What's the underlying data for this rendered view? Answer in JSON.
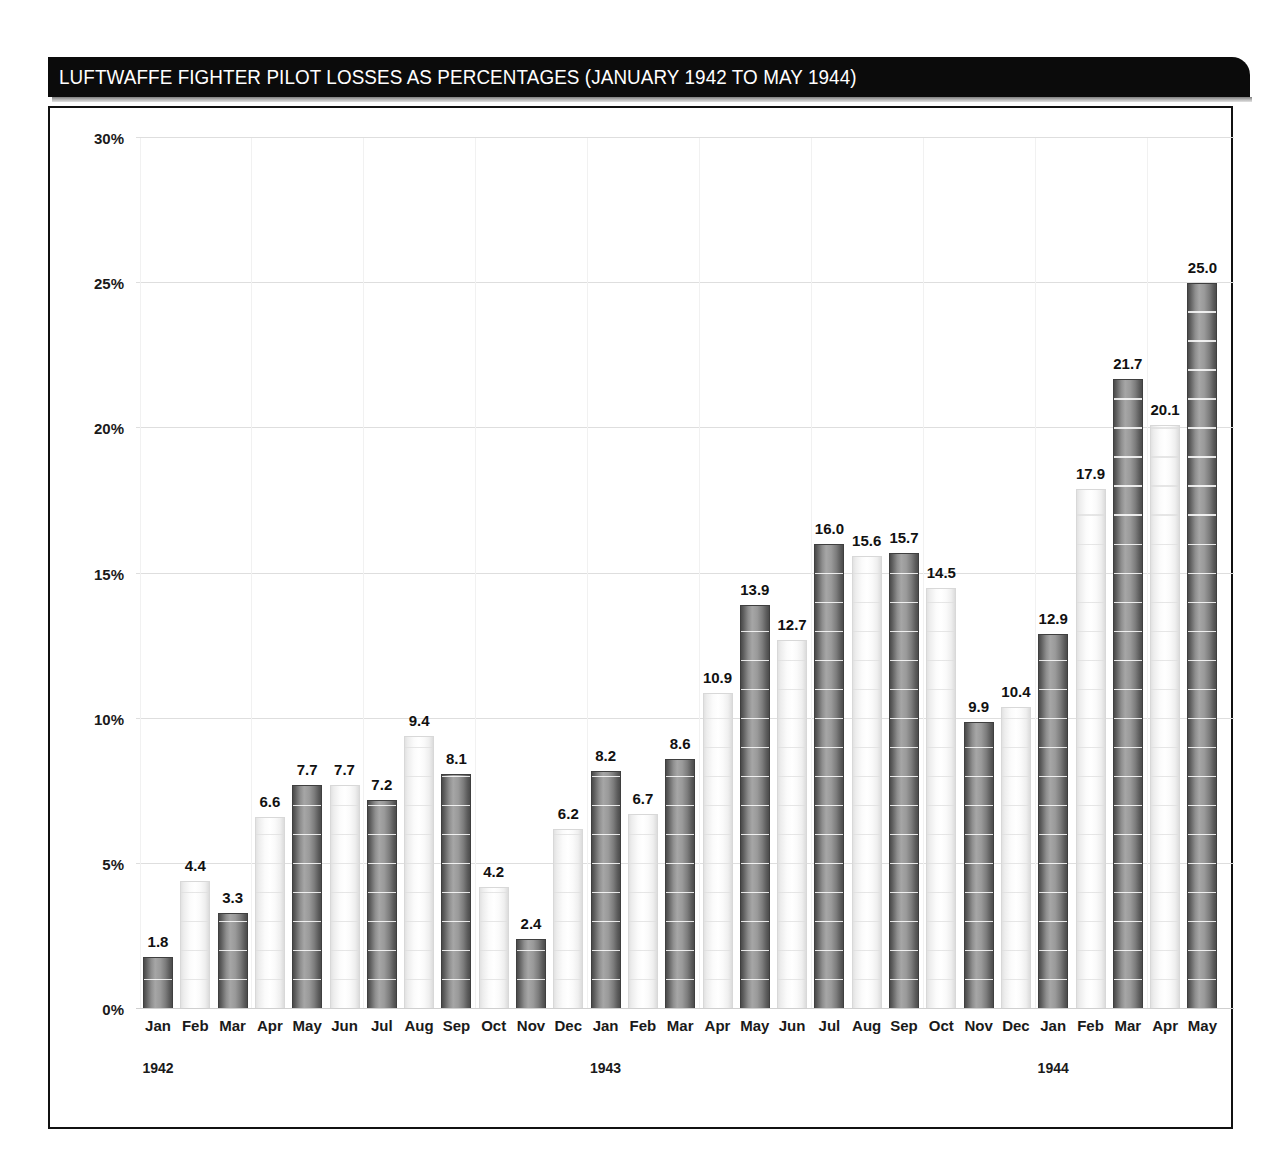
{
  "title": "LUFTWAFFE FIGHTER PILOT LOSSES AS PERCENTAGES (JANUARY 1942 TO MAY 1944)",
  "colors": {
    "title_bar_bg": "#0b0b0b",
    "title_text": "#ffffff",
    "frame_border": "#111111",
    "bar_dark": "#8e8e8e",
    "bar_light": "#f7f7f7",
    "grid": "#e9e9e9",
    "text": "#1a1a1a"
  },
  "axes": {
    "y_ticks": [
      "0%",
      "5%",
      "10%",
      "15%",
      "20%",
      "25%",
      "30%"
    ],
    "y_tick_values": [
      0,
      5,
      10,
      15,
      20,
      25,
      30
    ],
    "year_groups": [
      {
        "label": "1942",
        "start_index": 0,
        "count": 12
      },
      {
        "label": "1943",
        "start_index": 12,
        "count": 12
      },
      {
        "label": "1944",
        "start_index": 24,
        "count": 5
      }
    ]
  },
  "chart_data": {
    "type": "bar",
    "title": "LUFTWAFFE FIGHTER PILOT LOSSES AS PERCENTAGES (JANUARY 1942 TO MAY 1944)",
    "xlabel": "",
    "ylabel": "",
    "ylim": [
      0,
      30
    ],
    "y_tick_step": 5,
    "grid": true,
    "legend": false,
    "categories": [
      "Jan",
      "Feb",
      "Mar",
      "Apr",
      "May",
      "Jun",
      "Jul",
      "Aug",
      "Sep",
      "Oct",
      "Nov",
      "Dec",
      "Jan",
      "Feb",
      "Mar",
      "Apr",
      "May",
      "Jun",
      "Jul",
      "Aug",
      "Sep",
      "Oct",
      "Nov",
      "Dec",
      "Jan",
      "Feb",
      "Mar",
      "Apr",
      "May"
    ],
    "years": [
      "1942",
      "1942",
      "1942",
      "1942",
      "1942",
      "1942",
      "1942",
      "1942",
      "1942",
      "1942",
      "1942",
      "1942",
      "1943",
      "1943",
      "1943",
      "1943",
      "1943",
      "1943",
      "1943",
      "1943",
      "1943",
      "1943",
      "1943",
      "1943",
      "1944",
      "1944",
      "1944",
      "1944",
      "1944"
    ],
    "values": [
      1.8,
      4.4,
      3.3,
      6.6,
      7.7,
      7.7,
      7.2,
      9.4,
      8.1,
      4.2,
      2.4,
      6.2,
      8.2,
      6.7,
      8.6,
      10.9,
      13.9,
      12.7,
      16.0,
      15.6,
      15.7,
      14.5,
      9.9,
      10.4,
      12.9,
      17.9,
      21.7,
      20.1,
      25.0
    ],
    "labels": [
      "1.8",
      "4.4",
      "3.3",
      "6.6",
      "7.7",
      "7.7",
      "7.2",
      "9.4",
      "8.1",
      "4.2",
      "2.4",
      "6.2",
      "8.2",
      "6.7",
      "8.6",
      "10.9",
      "13.9",
      "12.7",
      "16.0",
      "15.6",
      "15.7",
      "14.5",
      "9.9",
      "10.4",
      "12.9",
      "17.9",
      "21.7",
      "20.1",
      "25.0"
    ],
    "shading": [
      "dark",
      "light",
      "dark",
      "light",
      "dark",
      "light",
      "dark",
      "light",
      "dark",
      "light",
      "dark",
      "light",
      "dark",
      "light",
      "dark",
      "light",
      "dark",
      "light",
      "dark",
      "light",
      "dark",
      "light",
      "dark",
      "light",
      "dark",
      "light",
      "dark",
      "light",
      "dark"
    ]
  }
}
